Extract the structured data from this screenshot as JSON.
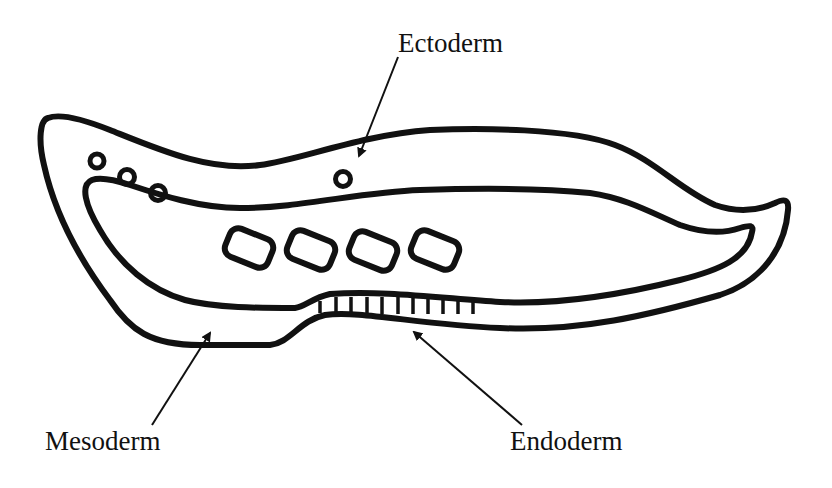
{
  "diagram": {
    "labels": {
      "ectoderm": "Ectoderm",
      "mesoderm": "Mesoderm",
      "endoderm": "Endoderm"
    },
    "colors": {
      "stroke": "#111111",
      "background": "#ffffff",
      "text": "#111111"
    }
  }
}
